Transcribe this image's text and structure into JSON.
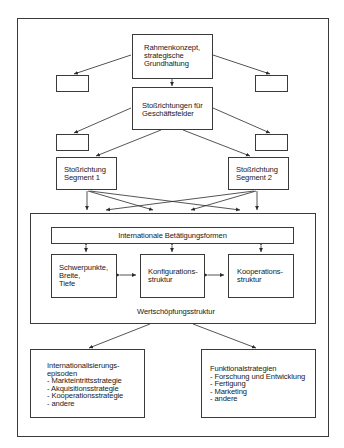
{
  "diagram": {
    "top_box": {
      "lines": [
        "Rahmenkonzept,",
        "strategische",
        "Grundhaltung"
      ]
    },
    "second_box": {
      "lines": [
        "Stoßrichtungen für",
        "Geschäftsfelder"
      ]
    },
    "segment1": {
      "lines": [
        "Stoßrichtung",
        "Segment 1"
      ]
    },
    "segment2": {
      "lines": [
        "Stoßrichtung",
        "Segment 2"
      ]
    },
    "empty_boxes": 4,
    "value_chain": {
      "label": "Wertschöpfungsstruktur",
      "bar": "Internationale Betätigungsformen",
      "sub": [
        {
          "lines": [
            "Schwerpunkte,",
            "Breite,",
            "Tiefe"
          ]
        },
        {
          "lines": [
            "Konfigurations-",
            "struktur"
          ]
        },
        {
          "lines": [
            "Kooperations-",
            "struktur"
          ]
        }
      ]
    },
    "bottom_left": {
      "lines": [
        "Internationalisierungs-",
        "episoden",
        "- Markteintrittsstrategie",
        "- Akquisitionsstrategie",
        "- Kooperationsstrategie",
        "- andere"
      ]
    },
    "bottom_right": {
      "lines": [
        "Funktionalstrategien",
        "- Forschung und Entwicklung",
        "- Fertigung",
        "- Marketing",
        "- andere"
      ]
    }
  }
}
